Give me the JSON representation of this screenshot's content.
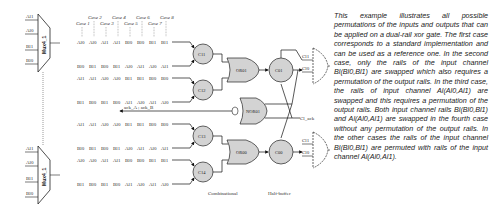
{
  "mux_top": {
    "name": "Mux4_1",
    "inputs": [
      "Al1",
      "Al0",
      "Bl1",
      "Bl0"
    ]
  },
  "mux_bottom": {
    "name": "Mux4_1",
    "inputs": [
      "Al1",
      "Al0",
      "Bl1",
      "Bl0"
    ]
  },
  "cases": [
    "Case 1",
    "Case 2",
    "Case 3",
    "Case 4",
    "Case 5",
    "Case 6",
    "Case 7",
    "Case 8"
  ],
  "label_rows": [
    [
      "Al0",
      "Al0",
      "Al1",
      "Al1",
      "Bl0",
      "Bl0",
      "Bl1",
      "Bl1"
    ],
    [
      "Bl0",
      "Bl1",
      "Bl0",
      "Bl1",
      "Al0",
      "Al1",
      "Al0",
      "Al1"
    ],
    [
      "Al1",
      "Al1",
      "Al0",
      "Al0",
      "Bl1",
      "Bl1",
      "Bl0",
      "Bl0"
    ],
    [
      "Bl1",
      "Bl0",
      "Bl1",
      "Bl0",
      "Al1",
      "Al0",
      "Al1",
      "Al0"
    ],
    [
      "Al1",
      "Al1",
      "Al0",
      "Al0",
      "Bl1",
      "Bl1",
      "Bl0",
      "Bl0"
    ],
    [
      "Bl0",
      "Bl1",
      "Bl0",
      "Bl1",
      "Al0",
      "Al1",
      "Al0",
      "Al1"
    ],
    [
      "Al0",
      "Al0",
      "Al1",
      "Al1",
      "Bl0",
      "Bl0",
      "Bl1",
      "Bl1"
    ],
    [
      "Bl1",
      "Bl0",
      "Bl1",
      "Bl0",
      "Al1",
      "Al0",
      "Al1",
      "Al0"
    ]
  ],
  "c_elements": [
    "C11",
    "C12",
    "C13",
    "C14"
  ],
  "or_gates": [
    "OR01",
    "OR00"
  ],
  "nor_gate": "NOR01",
  "output_c": [
    "C01",
    "C00"
  ],
  "ack_label": "ack_A ; ack_B",
  "cl_ack": "Cl_ack",
  "out_top": [
    "Cl1",
    "Cl0"
  ],
  "out_bottom": [
    "Cl1",
    "Cl0"
  ],
  "sections": [
    "Combinational",
    "Half-buffer"
  ],
  "description": "This example illustrates all possible permutations of the inputs and outputs that can be applied on a dual-rail xor gate. The first case corresponds to a standard implementation and can be used as a reference one. In the second case, only the rails of the input channel Bl(Bl0,Bl1) are swapped which also requires a permutation of the output rails. In the third case, the rails of input channel Al(Al0,Al1) are swapped and this requires a permutation of the output rails. Both input channel rails Bl(Bl0,Bl1) and Al(Al0,Al1) are swapped in the fourth case without any permutation of the output rails. In the other cases the rails of the input channel Bl(Bl0,Bl1) are permuted with rails of the input channel Al(Al0,Al1)."
}
